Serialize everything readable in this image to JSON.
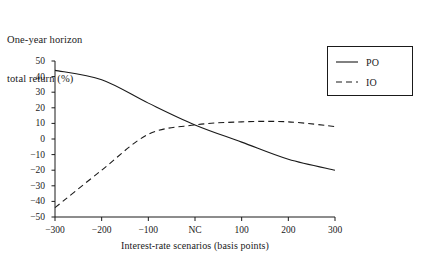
{
  "chart_data": {
    "type": "line",
    "title": "One-year horizon total return (%)",
    "title_lines": [
      "One-year horizon",
      "total return (%)"
    ],
    "xlabel": "Interest-rate scenarios (basis points)",
    "ylabel": "One-year horizon total return (%)",
    "x": [
      -300,
      -200,
      -100,
      0,
      100,
      200,
      300
    ],
    "x_tick_labels": [
      "−300",
      "−200",
      "−100",
      "NC",
      "100",
      "200",
      "300"
    ],
    "y_ticks": [
      -50,
      -40,
      -30,
      -20,
      -10,
      0,
      10,
      20,
      30,
      40,
      50
    ],
    "y_tick_labels": [
      "−50",
      "−40",
      "−30",
      "−20",
      "−10",
      "0",
      "10",
      "20",
      "30",
      "40",
      "50"
    ],
    "xlim": [
      -300,
      300
    ],
    "ylim": [
      -50,
      50
    ],
    "grid": false,
    "legend_position": "top-right",
    "series": [
      {
        "name": "PO",
        "style": "solid",
        "color": "#1a1a1a",
        "values": [
          44,
          38,
          23,
          9,
          -2,
          -13,
          -20
        ]
      },
      {
        "name": "IO",
        "style": "dashed",
        "color": "#1a1a1a",
        "values": [
          -44,
          -20,
          3,
          9,
          11,
          11,
          8
        ]
      }
    ]
  },
  "legend": {
    "items": [
      {
        "label": "PO",
        "style": "solid"
      },
      {
        "label": "IO",
        "style": "dashed"
      }
    ]
  }
}
